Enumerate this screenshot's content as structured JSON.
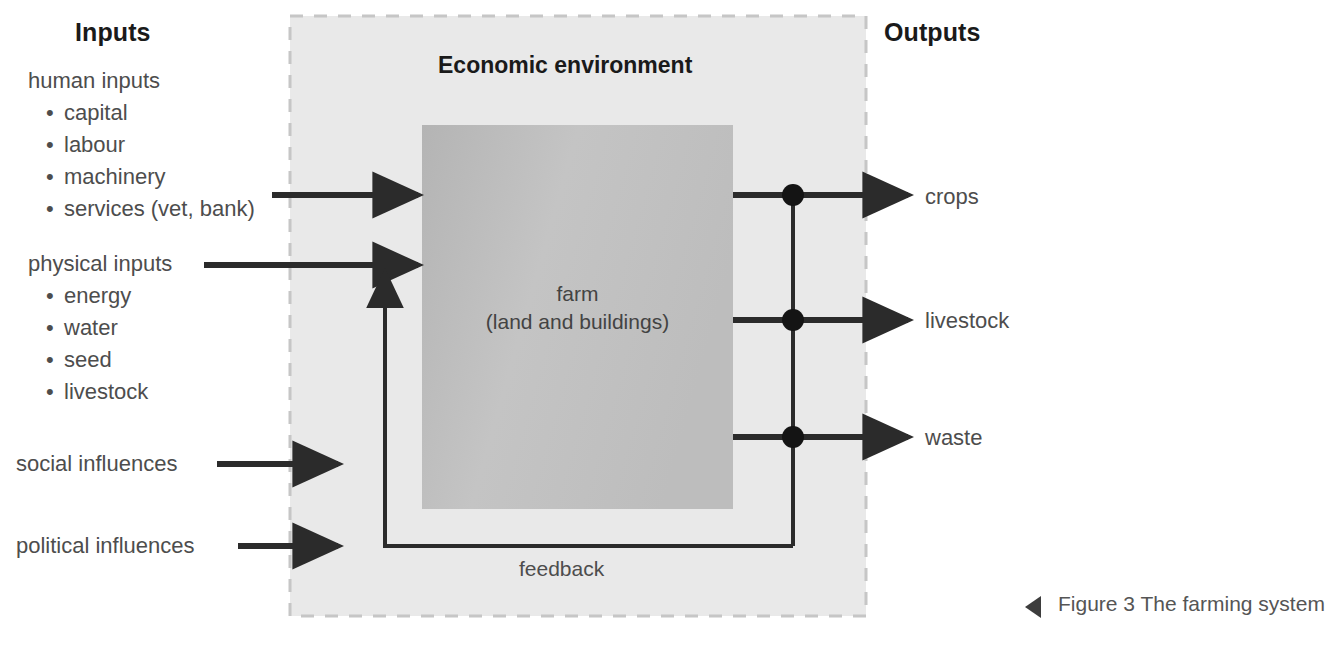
{
  "figure": {
    "caption": "Figure 3 The farming system",
    "caption_marker_icon": "left-triangle-icon"
  },
  "headings": {
    "inputs": "Inputs",
    "outputs": "Outputs"
  },
  "environment": {
    "title": "Economic environment",
    "fill_color": "#e9e9e9",
    "border_color": "#c9c9c9"
  },
  "farm": {
    "line1": "farm",
    "line2": "(land and buildings)",
    "fill_color": "#c0c0c0"
  },
  "inputs": {
    "groups": [
      {
        "title": "human inputs",
        "items": [
          "capital",
          "labour",
          "machinery",
          "services (vet, bank)"
        ]
      },
      {
        "title": "physical inputs",
        "items": [
          "energy",
          "water",
          "seed",
          "livestock"
        ]
      }
    ],
    "other": [
      "social influences",
      "political influences"
    ]
  },
  "outputs": {
    "items": [
      "crops",
      "livestock",
      "waste"
    ]
  },
  "feedback": {
    "label": "feedback"
  },
  "colors": {
    "line": "#2b2b2b",
    "text": "#4d4d4d",
    "heading": "#1a1a1a"
  }
}
